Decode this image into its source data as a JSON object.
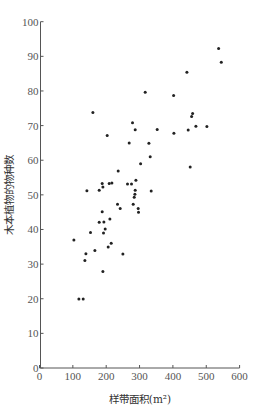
{
  "chart_data": {
    "type": "scatter",
    "title": "",
    "xlabel": "样带面积(m²)",
    "ylabel": "木本植物的物种数",
    "xlim": [
      0,
      600
    ],
    "ylim": [
      0,
      100
    ],
    "xticks": [
      0,
      100,
      200,
      300,
      400,
      500,
      600
    ],
    "yticks": [
      0,
      10,
      20,
      30,
      40,
      50,
      60,
      70,
      80,
      90,
      100
    ],
    "grid": false,
    "legend": null,
    "series": [
      {
        "name": "sample plots",
        "points": [
          [
            537,
            92.3
          ],
          [
            545,
            88.3
          ],
          [
            442,
            85.4
          ],
          [
            317,
            79.6
          ],
          [
            402,
            78.7
          ],
          [
            459,
            73.5
          ],
          [
            456,
            72.6
          ],
          [
            160,
            73.8
          ],
          [
            279,
            70.8
          ],
          [
            287,
            68.8
          ],
          [
            353,
            68.9
          ],
          [
            403,
            67.8
          ],
          [
            446,
            68.7
          ],
          [
            469,
            69.8
          ],
          [
            502,
            69.7
          ],
          [
            203,
            67.1
          ],
          [
            269,
            65.0
          ],
          [
            328,
            64.9
          ],
          [
            332,
            61.0
          ],
          [
            303,
            59.0
          ],
          [
            452,
            58.0
          ],
          [
            236,
            56.9
          ],
          [
            289,
            54.2
          ],
          [
            188,
            53.3
          ],
          [
            209,
            53.3
          ],
          [
            217,
            53.4
          ],
          [
            264,
            53.1
          ],
          [
            276,
            53.1
          ],
          [
            190,
            52.3
          ],
          [
            142,
            51.2
          ],
          [
            179,
            51.3
          ],
          [
            287,
            51.3
          ],
          [
            335,
            51.1
          ],
          [
            286,
            50.2
          ],
          [
            284,
            49.3
          ],
          [
            281,
            47.3
          ],
          [
            234,
            47.3
          ],
          [
            242,
            46.1
          ],
          [
            296,
            46.1
          ],
          [
            297,
            45.0
          ],
          [
            188,
            45.1
          ],
          [
            211,
            43.0
          ],
          [
            179,
            42.1
          ],
          [
            193,
            42.2
          ],
          [
            197,
            40.1
          ],
          [
            153,
            39.1
          ],
          [
            192,
            39.0
          ],
          [
            103,
            37.0
          ],
          [
            215,
            36.0
          ],
          [
            206,
            34.9
          ],
          [
            166,
            33.9
          ],
          [
            139,
            33.0
          ],
          [
            250,
            32.9
          ],
          [
            136,
            31.0
          ],
          [
            190,
            27.9
          ],
          [
            118,
            19.9
          ],
          [
            131,
            19.9
          ]
        ]
      }
    ]
  },
  "axis": {
    "x_title": "样带面积(m²)",
    "y_title": "木本植物的物种数"
  },
  "colors": {
    "marker": "#222222",
    "axis": "#555555"
  }
}
